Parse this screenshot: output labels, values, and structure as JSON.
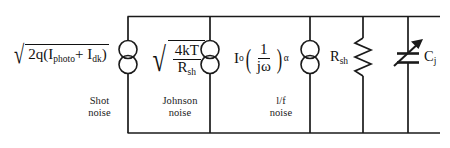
{
  "diagram": {
    "stroke_color": "#1a1a1a",
    "background": "#ffffff"
  },
  "branches": [
    {
      "id": "shot-noise",
      "element": "current-source",
      "formula_text": "sqrt(2q(I_photo + I_dk))",
      "caption_line1": "Shot",
      "caption_line2": "noise",
      "parts": {
        "lead": "2q(I",
        "sub1": "photo",
        "plus": "+ I",
        "sub2": "dk",
        "close": ")"
      }
    },
    {
      "id": "johnson-noise",
      "element": "current-source",
      "formula_text": "sqrt(4kT/R_sh)",
      "caption_line1": "Johnson",
      "caption_line2": "noise",
      "parts": {
        "numerator": "4kT",
        "denominator": "R",
        "den_sub": "sh"
      }
    },
    {
      "id": "flicker-noise",
      "element": "current-source",
      "formula_text": "I_o (1/(jw))^alpha",
      "caption_line1": "l/f",
      "caption_line2": "noise",
      "parts": {
        "coefficient": "I",
        "coef_sub": "o",
        "numerator": "1",
        "denominator": "jω",
        "exponent": "α"
      }
    },
    {
      "id": "shunt-resistance",
      "element": "resistor",
      "label": "R",
      "label_sub": "sh",
      "caption_line1": "",
      "caption_line2": ""
    },
    {
      "id": "junction-capacitance",
      "element": "variable-capacitor",
      "label": "C",
      "label_sub": "j",
      "caption_line1": "",
      "caption_line2": ""
    }
  ]
}
